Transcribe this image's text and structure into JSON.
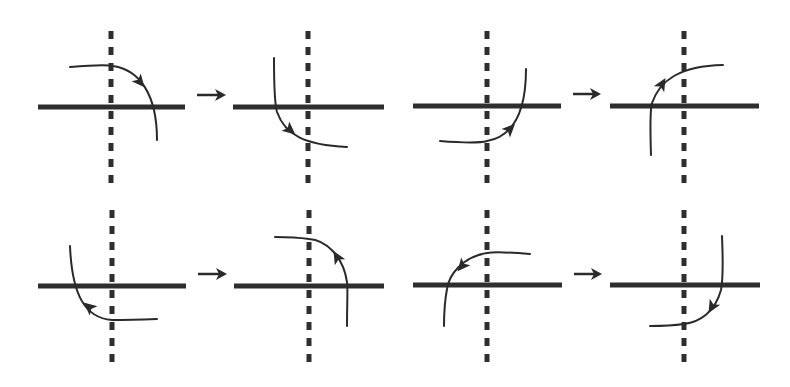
{
  "diagram": {
    "colors": {
      "line": "#2e2e2e",
      "dash": "#2e2e2e",
      "curve": "#2a2a2a",
      "background": "#ffffff"
    },
    "panels": [
      {
        "id": 1,
        "row": 0,
        "axis_x": 111,
        "line_y": 107,
        "line_x1": 38,
        "line_x2": 185,
        "curve": "M70,67 C95,65 108,65 113,66 C140,70 157,95 157,140",
        "arrowhead": {
          "x": 140,
          "y": 82,
          "angle": 50
        }
      },
      {
        "id": 2,
        "row": 0,
        "axis_x": 308,
        "line_y": 107,
        "line_x1": 233,
        "line_x2": 384,
        "curve": "M274,58 C274,90 275,105 277,112 C285,135 305,145 347,147",
        "arrowhead": {
          "x": 290,
          "y": 130,
          "angle": 40
        }
      },
      {
        "id": 3,
        "row": 0,
        "axis_x": 487,
        "line_y": 106,
        "line_x1": 413,
        "line_x2": 561,
        "curve": "M440,141 C465,143 480,143 487,141 C515,136 526,110 526,69",
        "arrowhead": {
          "x": 510,
          "y": 129,
          "angle": -45
        }
      },
      {
        "id": 4,
        "row": 0,
        "axis_x": 684,
        "line_y": 106,
        "line_x1": 610,
        "line_x2": 759,
        "curve": "M651,155 C650,125 650,110 652,103 C660,80 680,66 723,65",
        "arrowhead": {
          "x": 662,
          "y": 84,
          "angle": -60
        }
      },
      {
        "id": 5,
        "row": 1,
        "axis_x": 112,
        "line_y": 286,
        "line_x1": 38,
        "line_x2": 186,
        "curve": "M157,319 C130,320 118,320 112,320 C85,318 72,295 70,246",
        "arrowhead": {
          "x": 89,
          "y": 307,
          "angle": -140
        }
      },
      {
        "id": 6,
        "row": 1,
        "axis_x": 309,
        "line_y": 286,
        "line_x1": 234,
        "line_x2": 384,
        "curve": "M347,326 C347,300 348,290 347,282 C343,255 325,240 309,239 C295,237 285,237 275,237",
        "arrowhead": {
          "x": 337,
          "y": 257,
          "angle": -120
        }
      },
      {
        "id": 7,
        "row": 1,
        "axis_x": 487,
        "line_y": 285,
        "line_x1": 413,
        "line_x2": 562,
        "curve": "M530,254 C505,252 493,252 487,253 C462,257 449,275 447,289 C444,305 444,315 444,326",
        "arrowhead": {
          "x": 462,
          "y": 266,
          "angle": 130
        }
      },
      {
        "id": 8,
        "row": 1,
        "axis_x": 684,
        "line_y": 285,
        "line_x1": 610,
        "line_x2": 760,
        "curve": "M722,236 C723,260 723,280 721,290 C715,312 700,322 684,324 C670,326 660,326 650,326",
        "arrowhead": {
          "x": 712,
          "y": 307,
          "angle": 120
        }
      }
    ],
    "transition_arrows": [
      {
        "from_panel": 1,
        "to_panel": 2,
        "x1": 197,
        "x2": 226,
        "y": 95
      },
      {
        "from_panel": 3,
        "to_panel": 4,
        "x1": 573,
        "x2": 601,
        "y": 94
      },
      {
        "from_panel": 5,
        "to_panel": 6,
        "x1": 198,
        "x2": 227,
        "y": 274
      },
      {
        "from_panel": 7,
        "to_panel": 8,
        "x1": 574,
        "x2": 602,
        "y": 274
      }
    ],
    "axis_extent": {
      "row0": {
        "y1": 31,
        "y2": 184
      },
      "row1": {
        "y1": 210,
        "y2": 363
      }
    }
  }
}
